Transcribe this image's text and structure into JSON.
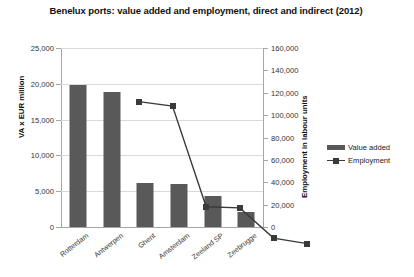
{
  "chart_data": {
    "type": "bar",
    "title": "Benelux ports: value added and employment, direct and indirect (2012)",
    "categories": [
      "Rotterdam",
      "Antwerpen",
      "Ghent",
      "Amsterdam",
      "Zeeland SP",
      "Zeebrugge"
    ],
    "series": [
      {
        "name": "Value added",
        "type": "bar",
        "axis": "left",
        "values": [
          19800,
          18800,
          6200,
          6000,
          4300,
          2100
        ],
        "color": "#595959"
      },
      {
        "name": "Employment",
        "type": "line",
        "axis": "right",
        "values": [
          155000,
          151000,
          61000,
          60000,
          33000,
          28000
        ],
        "color": "#3a3a3a"
      }
    ],
    "xlabel": "",
    "ylabel": "VA x EUR million",
    "ylabel_right": "Employment in labour units",
    "ylim": [
      0,
      25000
    ],
    "ylim_right": [
      0,
      160000
    ],
    "yticks": [
      0,
      5000,
      10000,
      15000,
      20000,
      25000
    ],
    "ytick_labels": [
      "0",
      "5,000",
      "10,000",
      "15,000",
      "20,000",
      "25,000"
    ],
    "yticks_right": [
      0,
      20000,
      40000,
      60000,
      80000,
      100000,
      120000,
      140000,
      160000
    ],
    "ytick_labels_right": [
      "0",
      "20,000",
      "40,000",
      "60,000",
      "80,000",
      "100,000",
      "120,000",
      "140,000",
      "160,000"
    ],
    "grid": true,
    "legend_position": "right"
  },
  "legend": {
    "items": [
      {
        "label": "Value added",
        "marker": "bar-swatch"
      },
      {
        "label": "Employment",
        "marker": "line-square-swatch"
      }
    ]
  }
}
